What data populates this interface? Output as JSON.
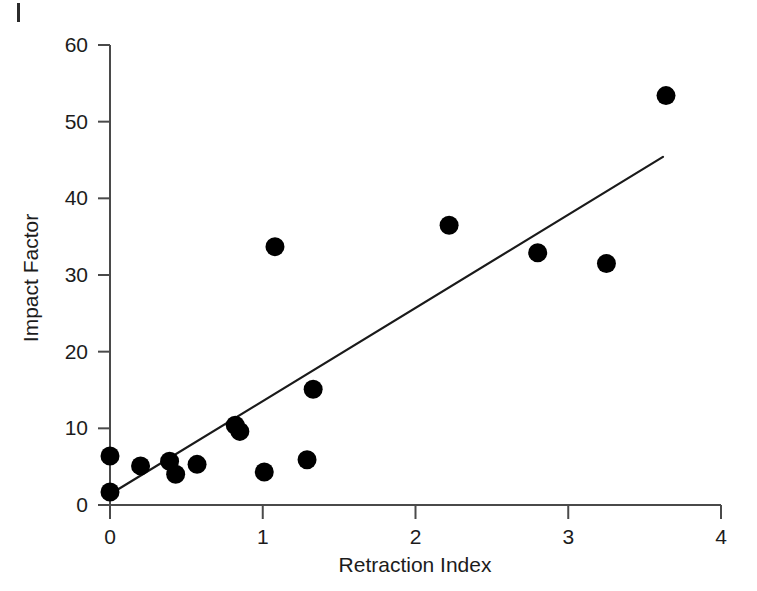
{
  "figure": {
    "corner_mark": "|",
    "background_color": "#ffffff",
    "marker_color": "#000000",
    "axis_color": "#4a4a4a",
    "line_color": "#1a1a1a"
  },
  "chart_data": {
    "type": "scatter",
    "title": "",
    "subtitle": "",
    "xlabel": "Retraction Index",
    "ylabel": "Impact Factor",
    "xlim": [
      0,
      4
    ],
    "ylim": [
      0,
      60
    ],
    "xticks": [
      0,
      1,
      2,
      3,
      4
    ],
    "yticks": [
      0,
      10,
      20,
      30,
      40,
      50,
      60
    ],
    "xtick_labels": [
      "0",
      "1",
      "2",
      "3",
      "4"
    ],
    "ytick_labels": [
      "0",
      "10",
      "20",
      "30",
      "40",
      "50",
      "60"
    ],
    "grid": false,
    "legend": null,
    "legend_position": "none",
    "series": [
      {
        "name": "Journals",
        "type": "scatter",
        "marker": "filled-circle",
        "color": "#000000",
        "points": [
          {
            "x": 0.0,
            "y": 6.4
          },
          {
            "x": 0.0,
            "y": 1.7
          },
          {
            "x": 0.2,
            "y": 5.1
          },
          {
            "x": 0.39,
            "y": 5.7
          },
          {
            "x": 0.43,
            "y": 4.0
          },
          {
            "x": 0.57,
            "y": 5.3
          },
          {
            "x": 0.82,
            "y": 10.4
          },
          {
            "x": 0.85,
            "y": 9.6
          },
          {
            "x": 1.01,
            "y": 4.3
          },
          {
            "x": 1.08,
            "y": 33.7
          },
          {
            "x": 1.29,
            "y": 5.9
          },
          {
            "x": 1.33,
            "y": 15.1
          },
          {
            "x": 2.22,
            "y": 36.5
          },
          {
            "x": 2.8,
            "y": 32.9
          },
          {
            "x": 3.25,
            "y": 31.5
          },
          {
            "x": 3.64,
            "y": 53.4
          }
        ]
      },
      {
        "name": "Regression line",
        "type": "line",
        "color": "#1a1a1a",
        "endpoints": [
          {
            "x": 0.0,
            "y": 1.4
          },
          {
            "x": 3.62,
            "y": 45.4
          }
        ]
      }
    ]
  }
}
